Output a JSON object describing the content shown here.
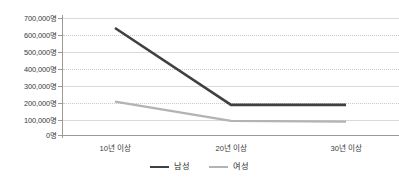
{
  "chart_data": {
    "type": "line",
    "title": "",
    "subtitle": "",
    "xlabel": "",
    "ylabel": "",
    "categories": [
      "10년 이상",
      "20년 이상",
      "30년 이상"
    ],
    "series": [
      {
        "name": "남성",
        "color": "#404040",
        "values": [
          640000,
          180000,
          180000
        ]
      },
      {
        "name": "여성",
        "color": "#b3b3b3",
        "values": [
          200000,
          85000,
          80000
        ]
      }
    ],
    "ylim": [
      0,
      700000
    ],
    "y_ticks": [
      0,
      100000,
      200000,
      300000,
      400000,
      500000,
      600000,
      700000
    ],
    "y_tick_labels": [
      "0명",
      "100,000명",
      "200,000명",
      "300,000명",
      "400,000명",
      "500,000명",
      "600,000명",
      "700,000명"
    ],
    "grid": true,
    "grid_style": "alternating-solid-dotted",
    "legend_position": "bottom",
    "axis_color": "#9a9a9a",
    "grid_color": "#d9d9d9",
    "grid_dotted_color": "#c9c9c9",
    "background_color": "#ffffff",
    "text_color": "#3a3a3a"
  },
  "legend": {
    "items": [
      {
        "label": "남성",
        "color": "#404040"
      },
      {
        "label": "여성",
        "color": "#b3b3b3"
      }
    ]
  }
}
